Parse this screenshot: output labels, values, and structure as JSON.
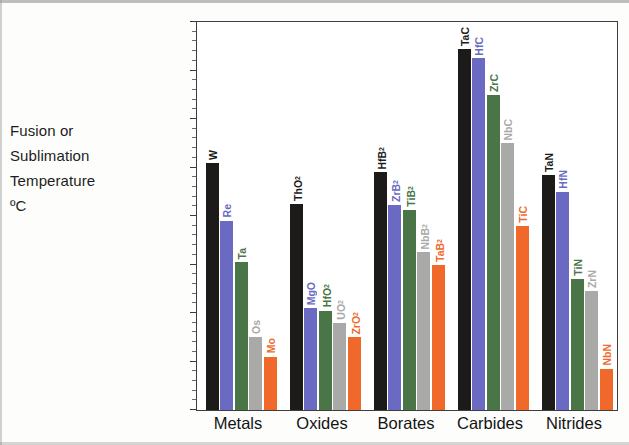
{
  "axis_title": {
    "line1": "Fusion or",
    "line2": "Sublimation",
    "line3": "Temperature",
    "line4": "ºC"
  },
  "chart_data": {
    "type": "bar",
    "title": "",
    "subtitle": "",
    "xlabel": "",
    "ylabel": "Fusion or Sublimation Temperature ºC",
    "ylim": [
      2400,
      4000
    ],
    "ytick_step": 200,
    "ytick_labels": [
      "4000",
      "3800",
      "3600",
      "3400",
      "3200",
      "3000",
      "2800",
      "2600",
      "2400"
    ],
    "grid": false,
    "legend": "none",
    "categories": [
      "Metals",
      "Oxides",
      "Borates",
      "Carbides",
      "Nitrides"
    ],
    "series_colors": {
      "black": "#1c1b1a",
      "blue": "#6a6ac2",
      "green": "#4a7546",
      "gray": "#a9a9a7",
      "orange": "#f0692a"
    },
    "groups": [
      {
        "category": "Metals",
        "bars": [
          {
            "label": "W",
            "label_html": "W",
            "value": 3420,
            "color": "#1c1b1a"
          },
          {
            "label": "Re",
            "label_html": "Re",
            "value": 3180,
            "color": "#6a6ac2"
          },
          {
            "label": "Ta",
            "label_html": "Ta",
            "value": 3010,
            "color": "#4a7546"
          },
          {
            "label": "Os",
            "label_html": "Os",
            "value": 2700,
            "color": "#a9a9a7"
          },
          {
            "label": "Mo",
            "label_html": "Mo",
            "value": 2620,
            "color": "#f0692a"
          }
        ]
      },
      {
        "category": "Oxides",
        "bars": [
          {
            "label": "ThO2",
            "label_html": "ThO<sub>2</sub>",
            "value": 3250,
            "color": "#1c1b1a"
          },
          {
            "label": "MgO",
            "label_html": "MgO",
            "value": 2820,
            "color": "#6a6ac2"
          },
          {
            "label": "HfO2",
            "label_html": "HfO<sub>2</sub>",
            "value": 2810,
            "color": "#4a7546"
          },
          {
            "label": "UO2",
            "label_html": "UO<sub>2</sub>",
            "value": 2760,
            "color": "#a9a9a7"
          },
          {
            "label": "ZrO2",
            "label_html": "ZrO<sub>2</sub>",
            "value": 2700,
            "color": "#f0692a"
          }
        ]
      },
      {
        "category": "Borates",
        "bars": [
          {
            "label": "HfB2",
            "label_html": "HfB<sub>2</sub>",
            "value": 3380,
            "color": "#1c1b1a"
          },
          {
            "label": "ZrB2",
            "label_html": "ZrB<sub>2</sub>",
            "value": 3245,
            "color": "#6a6ac2"
          },
          {
            "label": "TiB2",
            "label_html": "TiB<sub>2</sub>",
            "value": 3225,
            "color": "#4a7546"
          },
          {
            "label": "NbB2",
            "label_html": "NbB<sub>2</sub>",
            "value": 3050,
            "color": "#a9a9a7"
          },
          {
            "label": "TaB2",
            "label_html": "TaB<sub>2</sub>",
            "value": 3000,
            "color": "#f0692a"
          }
        ]
      },
      {
        "category": "Carbides",
        "bars": [
          {
            "label": "TaC",
            "label_html": "TaC",
            "value": 3890,
            "color": "#1c1b1a"
          },
          {
            "label": "HfC",
            "label_html": "HfC",
            "value": 3850,
            "color": "#6a6ac2"
          },
          {
            "label": "ZrC",
            "label_html": "ZrC",
            "value": 3700,
            "color": "#4a7546"
          },
          {
            "label": "NbC",
            "label_html": "NbC",
            "value": 3500,
            "color": "#a9a9a7"
          },
          {
            "label": "TiC",
            "label_html": "TiC",
            "value": 3160,
            "color": "#f0692a"
          }
        ]
      },
      {
        "category": "Nitrides",
        "bars": [
          {
            "label": "TaN",
            "label_html": "TaN",
            "value": 3370,
            "color": "#1c1b1a"
          },
          {
            "label": "HfN",
            "label_html": "HfN",
            "value": 3300,
            "color": "#6a6ac2"
          },
          {
            "label": "TiN",
            "label_html": "TiN",
            "value": 2940,
            "color": "#4a7546"
          },
          {
            "label": "ZrN",
            "label_html": "ZrN",
            "value": 2890,
            "color": "#a9a9a7"
          },
          {
            "label": "NbN",
            "label_html": "NbN",
            "value": 2570,
            "color": "#f0692a"
          }
        ]
      }
    ]
  }
}
